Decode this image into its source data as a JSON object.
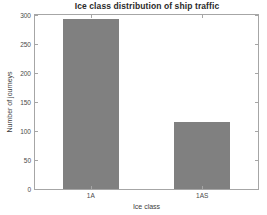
{
  "chart_data": {
    "type": "bar",
    "title": "Ice class distribution of ship traffic",
    "xlabel": "Ice class",
    "ylabel": "Number of journeys",
    "categories": [
      "1A",
      "1AS"
    ],
    "values": [
      293,
      115
    ],
    "ylim": [
      0,
      300
    ],
    "yticks": [
      0,
      50,
      100,
      150,
      200,
      250,
      300
    ],
    "ytick_labels": [
      "0",
      "50",
      "100",
      "150",
      "200",
      "250",
      "300"
    ],
    "grid": false,
    "legend": null,
    "bar_color": "#808080",
    "axis_color": "#a6a6a6",
    "background": "#ffffff"
  }
}
